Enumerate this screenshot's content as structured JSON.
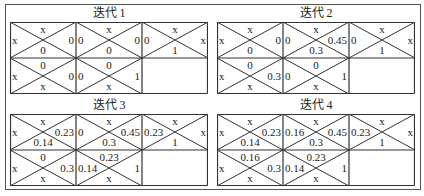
{
  "panels": [
    {
      "title": "迭代 1",
      "cells": [
        {
          "top": "x",
          "left": "x",
          "right": "0",
          "bottom": "0"
        },
        {
          "top": "x",
          "left": "0",
          "right": "0",
          "bottom": "0"
        },
        {
          "top": "x",
          "left": "0",
          "right": "x",
          "bottom": "1"
        },
        {
          "top": "0",
          "left": "x",
          "right": "0",
          "bottom": "x"
        },
        {
          "top": "0",
          "left": "0",
          "right": "1",
          "bottom": "x"
        }
      ]
    },
    {
      "title": "迭代 2",
      "cells": [
        {
          "top": "x",
          "left": "x",
          "right": "0",
          "bottom": "0"
        },
        {
          "top": "x",
          "left": "0",
          "right": "0.45",
          "bottom": "0.3"
        },
        {
          "top": "x",
          "left": "0",
          "right": "x",
          "bottom": "1"
        },
        {
          "top": "0",
          "left": "x",
          "right": "0.3",
          "bottom": "x"
        },
        {
          "top": "0",
          "left": "0",
          "right": "1",
          "bottom": "x"
        }
      ]
    },
    {
      "title": "迭代 3",
      "cells": [
        {
          "top": "x",
          "left": "x",
          "right": "0.23",
          "bottom": "0.14"
        },
        {
          "top": "x",
          "left": "0",
          "right": "0.45",
          "bottom": "0.3"
        },
        {
          "top": "x",
          "left": "0.23",
          "right": "x",
          "bottom": "1"
        },
        {
          "top": "0",
          "left": "x",
          "right": "0.3",
          "bottom": "x"
        },
        {
          "top": "0.23",
          "left": "0.14",
          "right": "1",
          "bottom": "x"
        }
      ]
    },
    {
      "title": "迭代 4",
      "cells": [
        {
          "top": "x",
          "left": "x",
          "right": "0.23",
          "bottom": "0.14"
        },
        {
          "top": "x",
          "left": "0.16",
          "right": "0.45",
          "bottom": "0.3"
        },
        {
          "top": "x",
          "left": "0.23",
          "right": "x",
          "bottom": "1"
        },
        {
          "top": "0.16",
          "left": "x",
          "right": "0.3",
          "bottom": "x"
        },
        {
          "top": "0.23",
          "left": "0.14",
          "right": "1",
          "bottom": "x"
        }
      ]
    }
  ]
}
